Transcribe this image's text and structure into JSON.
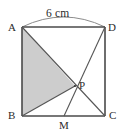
{
  "figure": {
    "type": "geometry-diagram",
    "shape": "square",
    "canvas": {
      "width": 126,
      "height": 136
    },
    "background_color": "#ffffff",
    "stroke_color": "#4a4a4a",
    "shaded_fill_color": "#cdcdcd",
    "label_color": "#2b2b2b",
    "dimension": {
      "label": "6 cm",
      "applies_to": "AD",
      "brace_style": "arc"
    },
    "vertices": [
      {
        "name": "A",
        "label": "A",
        "x": 22,
        "y": 27,
        "label_x": 8,
        "label_y": 22
      },
      {
        "name": "D",
        "label": "D",
        "x": 105,
        "y": 27,
        "label_x": 108,
        "label_y": 22
      },
      {
        "name": "B",
        "label": "B",
        "x": 22,
        "y": 116,
        "label_x": 8,
        "label_y": 111
      },
      {
        "name": "C",
        "label": "C",
        "x": 105,
        "y": 116,
        "label_x": 108,
        "label_y": 111
      },
      {
        "name": "P",
        "label": "P",
        "x": 75,
        "y": 86,
        "label_x": 79,
        "label_y": 80
      },
      {
        "name": "M",
        "label": "M",
        "x": 64,
        "y": 116,
        "label_x": 60,
        "label_y": 120
      }
    ],
    "segments": [
      {
        "name": "side-AD",
        "from": "A",
        "to": "D"
      },
      {
        "name": "side-DC",
        "from": "D",
        "to": "C"
      },
      {
        "name": "side-CB",
        "from": "C",
        "to": "B"
      },
      {
        "name": "side-BA",
        "from": "B",
        "to": "A"
      },
      {
        "name": "diagonal-AC",
        "from": "A",
        "to": "C"
      },
      {
        "name": "cevian-DM",
        "from": "D",
        "to": "M"
      },
      {
        "name": "segment-BP",
        "from": "B",
        "to": "P"
      }
    ],
    "shaded_region": {
      "name": "triangle-ABP",
      "vertices": [
        "A",
        "B",
        "P"
      ]
    }
  }
}
